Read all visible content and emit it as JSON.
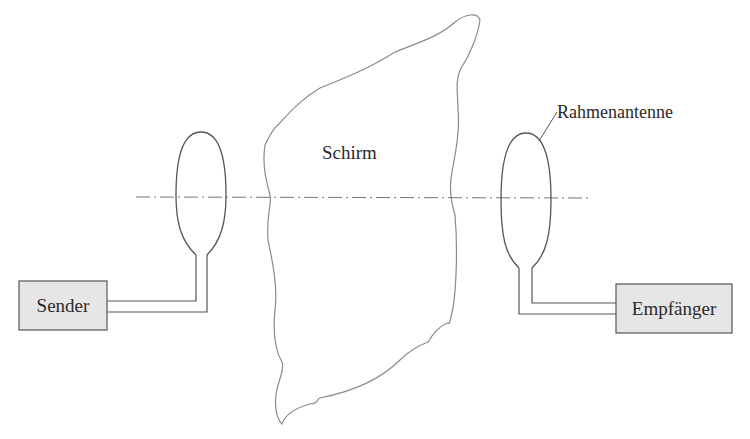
{
  "diagram": {
    "type": "shielding-measurement-setup",
    "labels": {
      "shield": "Schirm",
      "loop_antenna": "Rahmenantenne",
      "transmitter": "Sender",
      "receiver": "Empfänger"
    },
    "colors": {
      "line": "#555555",
      "shield_outline": "#8a8a8a",
      "box_fill": "#e6e6e6",
      "axis_line": "#777777",
      "text": "#2a2a2a"
    }
  }
}
